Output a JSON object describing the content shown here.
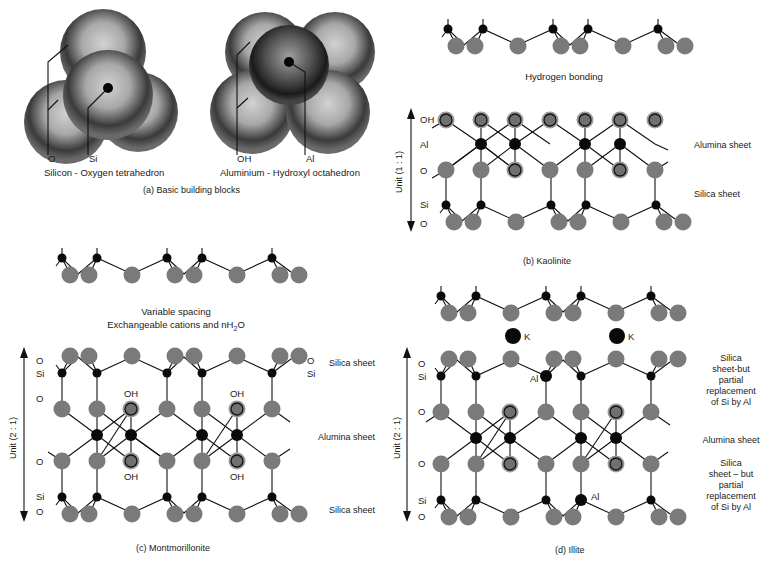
{
  "figure": {
    "panel_a": {
      "caption": "(a)   Basic building blocks",
      "tetrahedron": {
        "title": "Silicon - Oxygen tetrahedron",
        "label_o": "O",
        "label_si": "Si"
      },
      "octahedron": {
        "title": "Aluminium - Hydroxyl octahedron",
        "label_oh": "OH",
        "label_al": "Al"
      }
    },
    "panel_b": {
      "caption": "(b)   Kaolinite",
      "interlayer": "Hydrogen bonding",
      "unit_label": "Unit (1 : 1)",
      "row_labels": [
        "OH",
        "Al",
        "O",
        "Si",
        "O"
      ],
      "sheet_labels": [
        "Alumina sheet",
        "Silica sheet"
      ]
    },
    "panel_c": {
      "caption": "(c)   Montmorillonite",
      "interlayer_line1": "Variable spacing",
      "interlayer_line2": "Exchangeable cations and nH",
      "interlayer_sub": "2",
      "interlayer_tail": "O",
      "unit_label": "Unit (2 : 1)",
      "row_labels": [
        "O",
        "Si",
        "O",
        "O",
        "Si",
        "O"
      ],
      "right_labels": [
        "O",
        "Si"
      ],
      "oh_label": "OH",
      "sheet_labels": [
        "Silica sheet",
        "Alumina sheet",
        "Silica sheet"
      ]
    },
    "panel_d": {
      "caption": "(d)   Illite",
      "cation_label": "K",
      "unit_label": "Unit (2 : 1)",
      "row_labels": [
        "O",
        "Si",
        "O",
        "O",
        "Si",
        "O"
      ],
      "al_label": "Al",
      "sheet_top": [
        "Silica",
        "sheet-but",
        "partial",
        "replacement",
        "of Si by Al"
      ],
      "sheet_mid": "Alumina sheet",
      "sheet_bottom": [
        "Silica",
        "sheet – but",
        "partial",
        "replacement",
        "of Si by Al"
      ]
    },
    "colors": {
      "oxygen": "#777777",
      "hydroxyl_ring": "#999999",
      "atom_dark": "#0a0a0a",
      "line": "#111111"
    }
  }
}
